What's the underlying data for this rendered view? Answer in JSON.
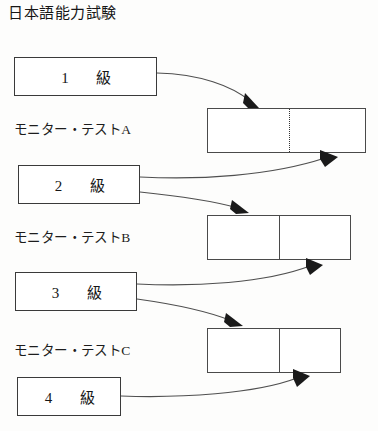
{
  "diagram": {
    "title": "日本語能力試験",
    "grades": [
      {
        "id": "grade-1",
        "number": "1",
        "suffix": "級",
        "label": "1　級"
      },
      {
        "id": "grade-2",
        "number": "2",
        "suffix": "級",
        "label": "2　級"
      },
      {
        "id": "grade-3",
        "number": "3",
        "suffix": "級",
        "label": "3　級"
      },
      {
        "id": "grade-4",
        "number": "4",
        "suffix": "級",
        "label": "4　級"
      }
    ],
    "tests": [
      {
        "id": "test-a",
        "label": "モニター・テストA",
        "divider": "dotted"
      },
      {
        "id": "test-b",
        "label": "モニター・テストB",
        "divider": "solid"
      },
      {
        "id": "test-c",
        "label": "モニター・テストC",
        "divider": "solid"
      }
    ],
    "colors": {
      "background": "#fdfdfc",
      "box_border": "#3a3a3a",
      "test_border": "#4a4a4a",
      "arrow_line": "#4f4f4f",
      "arrow_head": "#1a1a1a",
      "text": "#161616"
    }
  }
}
